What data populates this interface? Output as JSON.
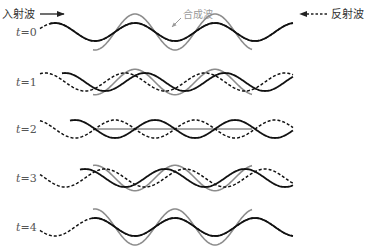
{
  "legend": {
    "incident_label": "入射波",
    "incident_direction": "right",
    "reflected_label": "反射波",
    "reflected_direction": "left",
    "composite_label": "合成波"
  },
  "colors": {
    "incident": "#111111",
    "reflected": "#111111",
    "composite": "#8c8c8c",
    "label": "#555555"
  },
  "wave": {
    "wavelength_units": 1,
    "amplitude_units": 1,
    "phase_step_per_t": 0.125
  },
  "rows": [
    {
      "t_var": "t",
      "t_eq": "=0",
      "t": 0,
      "incident_crest_phase": 0.0,
      "reflected_crest_phase": 0.0,
      "composite": "2A, in phase"
    },
    {
      "t_var": "t",
      "t_eq": "=1",
      "t": 1,
      "incident_crest_phase": 0.125,
      "reflected_crest_phase": -0.125,
      "composite": "reduced amplitude"
    },
    {
      "t_var": "t",
      "t_eq": "=2",
      "t": 2,
      "incident_crest_phase": 0.25,
      "reflected_crest_phase": -0.25,
      "composite": "zero (flat)"
    },
    {
      "t_var": "t",
      "t_eq": "=3",
      "t": 3,
      "incident_crest_phase": 0.375,
      "reflected_crest_phase": -0.375,
      "composite": "reduced amplitude, inverted"
    },
    {
      "t_var": "t",
      "t_eq": "=4",
      "t": 4,
      "incident_crest_phase": 0.5,
      "reflected_crest_phase": -0.5,
      "composite": "2A, inverted"
    }
  ]
}
